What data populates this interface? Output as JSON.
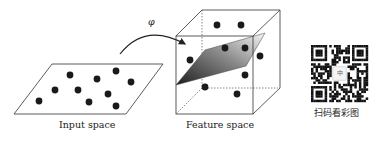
{
  "figure": {
    "mapping_symbol": "φ",
    "input_space": {
      "label": "Input space",
      "points": [
        [
          70,
          75
        ],
        [
          97,
          79
        ],
        [
          116,
          71
        ],
        [
          39,
          101
        ],
        [
          55,
          90
        ],
        [
          78,
          90
        ],
        [
          89,
          102
        ],
        [
          108,
          94
        ],
        [
          116,
          106
        ],
        [
          131,
          82
        ]
      ]
    },
    "feature_space": {
      "label": "Feature space",
      "points_above": [
        [
          217,
          25
        ],
        [
          241,
          25
        ],
        [
          225,
          48
        ],
        [
          245,
          48
        ],
        [
          190,
          60
        ]
      ],
      "points_below": [
        [
          205,
          87
        ],
        [
          245,
          75
        ],
        [
          237,
          94
        ],
        [
          260,
          56
        ]
      ]
    },
    "qr": {
      "caption": "扫码看彩图",
      "center_badge": "中"
    },
    "colors": {
      "line": "#333333",
      "dot": "#1a1a1a",
      "plane_light": "#f2f2f2",
      "plane_dark": "#2a2a2a"
    }
  }
}
